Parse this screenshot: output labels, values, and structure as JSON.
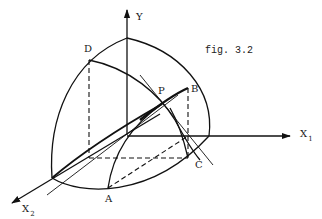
{
  "figure": {
    "caption": "fig. 3.2",
    "colors": {
      "ink": "#111111",
      "background": "#ffffff"
    },
    "axes": {
      "y": {
        "label": "Y"
      },
      "x1": {
        "label": "X",
        "subscript": "1"
      },
      "x2": {
        "label": "X",
        "subscript": "2"
      }
    },
    "points": {
      "A": "A",
      "B": "B",
      "C": "C",
      "D": "D",
      "P": "P"
    }
  }
}
